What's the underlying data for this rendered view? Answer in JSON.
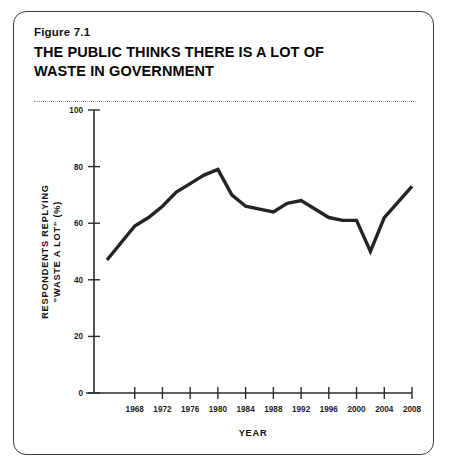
{
  "figure": {
    "number": "Figure 7.1",
    "title": "THE PUBLIC THINKS THERE IS A LOT OF WASTE IN GOVERNMENT"
  },
  "chart_data": {
    "type": "line",
    "title": "THE PUBLIC THINKS THERE IS A LOT OF WASTE IN GOVERNMENT",
    "xlabel": "YEAR",
    "ylabel": "RESPONDENTS REPLYING \"WASTE A LOT\" (%)",
    "ylabel_line1": "RESPONDENTS REPLYING",
    "ylabel_line2": "\"WASTE A LOT\" (%)",
    "xlim": [
      1964,
      2010
    ],
    "ylim": [
      0,
      100
    ],
    "grid": false,
    "legend": null,
    "xticks": [
      1968,
      1972,
      1976,
      1980,
      1984,
      1988,
      1992,
      1996,
      2000,
      2004,
      2008
    ],
    "xtick_labels": [
      "1968",
      "1972",
      "1976",
      "1980",
      "1984",
      "1988",
      "1992",
      "1996",
      "2000",
      "2004",
      "2008"
    ],
    "yticks": [
      0,
      20,
      40,
      60,
      80,
      100
    ],
    "ytick_labels": [
      "0",
      "20",
      "40",
      "60",
      "80",
      "100"
    ],
    "series": [
      {
        "name": "Waste a lot",
        "color": "#242424",
        "x": [
          1964,
          1968,
          1970,
          1972,
          1974,
          1976,
          1978,
          1980,
          1982,
          1984,
          1986,
          1988,
          1990,
          1992,
          1994,
          1996,
          1998,
          2000,
          2002,
          2004,
          2008
        ],
        "values": [
          47,
          59,
          62,
          66,
          71,
          74,
          77,
          79,
          70,
          66,
          65,
          64,
          67,
          68,
          65,
          62,
          61,
          61,
          50,
          62,
          73
        ]
      }
    ]
  }
}
